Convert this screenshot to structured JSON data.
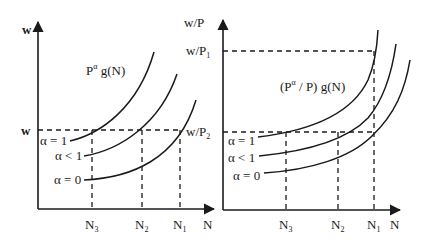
{
  "left_panel": {
    "y_axis_label": "w",
    "x_axis_label": "N",
    "wage_level_label": "w",
    "function_label_base": "P",
    "function_label_sup": "α",
    "function_label_rest": " g(N)",
    "curves": [
      {
        "label": "α = 1"
      },
      {
        "label": "α < 1"
      },
      {
        "label": "α = 0"
      }
    ],
    "x_ticks": [
      {
        "base": "N",
        "sub": "3"
      },
      {
        "base": "N",
        "sub": "2"
      },
      {
        "base": "N",
        "sub": "1"
      }
    ]
  },
  "right_panel": {
    "y_axis_label": "w/P",
    "x_axis_label": "N",
    "level_high_base": "w/P",
    "level_high_sub": "1",
    "level_low_base": "w/P",
    "level_low_sub": "2",
    "function_label_a": "(P",
    "function_label_sup": "α",
    "function_label_b": " / P) g(N)",
    "curves": [
      {
        "label": "α = 1"
      },
      {
        "label": "α < 1"
      },
      {
        "label": "α = 0"
      }
    ],
    "x_ticks": [
      {
        "base": "N",
        "sub": "3"
      },
      {
        "base": "N",
        "sub": "2"
      },
      {
        "base": "N",
        "sub": "1"
      }
    ]
  },
  "colors": {
    "ink": "#1a1a1a",
    "background": "#ffffff"
  }
}
